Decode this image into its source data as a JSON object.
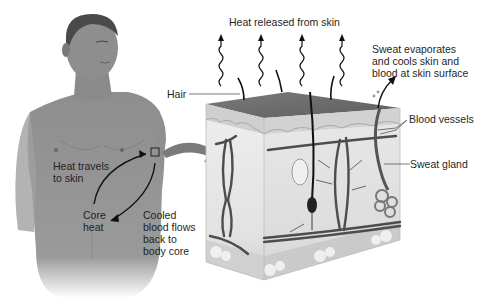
{
  "diagram": {
    "type": "anatomical-illustration",
    "colors": {
      "background": "#ffffff",
      "skin_figure": "#8c8c8c",
      "epidermis_top": "#6e6e6e",
      "dermis": "#e6e6e6",
      "subcutaneous": "#d4d4d4",
      "vessel": "#4a4a4a",
      "arrow": "#111111",
      "callout_arrow": "#6a6a6a"
    }
  },
  "labels": {
    "heat_released": "Heat released from skin",
    "hair": "Hair",
    "sweat_evaporates": [
      "Sweat evaporates",
      "and cools skin and",
      "blood at skin surface"
    ],
    "blood_vessels": "Blood vessels",
    "sweat_gland": "Sweat gland",
    "heat_travels": [
      "Heat travels",
      "to skin"
    ],
    "core_heat": [
      "Core",
      "heat"
    ],
    "cooled_blood": [
      "Cooled",
      "blood flows",
      "back to",
      "body core"
    ]
  },
  "icons": {
    "heat_wave_arrows": 4,
    "callout_square": "magnify-region-icon",
    "zoom_arrow": "curved-arrow-icon"
  }
}
